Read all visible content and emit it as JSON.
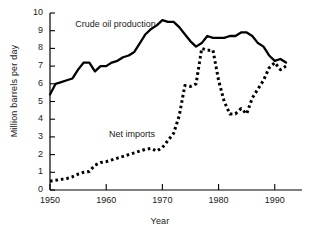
{
  "chart_data": {
    "type": "line",
    "title": "",
    "xlabel": "Year",
    "ylabel": "Million barrels per day",
    "xlim": [
      1950,
      1992
    ],
    "ylim": [
      0,
      10
    ],
    "xticks": [
      1950,
      1960,
      1970,
      1980,
      1990
    ],
    "yticks": [
      0,
      1,
      2,
      3,
      4,
      5,
      6,
      7,
      8,
      9,
      10
    ],
    "grid": false,
    "legend": "inline-annotations",
    "annotations": [
      {
        "text": "Crude oil production",
        "x": 1954.5,
        "y": 9.35
      },
      {
        "text": "Net imports",
        "x": 1960.5,
        "y": 3.1
      }
    ],
    "series": [
      {
        "name": "Crude oil production",
        "style": "solid",
        "color": "#000000",
        "x": [
          1950,
          1951,
          1952,
          1953,
          1954,
          1955,
          1956,
          1957,
          1958,
          1959,
          1960,
          1961,
          1962,
          1963,
          1964,
          1965,
          1966,
          1967,
          1968,
          1969,
          1970,
          1971,
          1972,
          1973,
          1974,
          1975,
          1976,
          1977,
          1978,
          1979,
          1980,
          1981,
          1982,
          1983,
          1984,
          1985,
          1986,
          1987,
          1988,
          1989,
          1990,
          1991,
          1992
        ],
        "values": [
          5.4,
          6.0,
          6.1,
          6.2,
          6.3,
          6.8,
          7.2,
          7.2,
          6.7,
          7.0,
          7.0,
          7.2,
          7.3,
          7.5,
          7.6,
          7.8,
          8.3,
          8.8,
          9.1,
          9.3,
          9.6,
          9.5,
          9.5,
          9.2,
          8.8,
          8.4,
          8.1,
          8.3,
          8.7,
          8.6,
          8.6,
          8.6,
          8.7,
          8.7,
          8.9,
          8.9,
          8.7,
          8.3,
          8.1,
          7.6,
          7.3,
          7.4,
          7.2
        ]
      },
      {
        "name": "Net imports",
        "style": "dotted",
        "color": "#000000",
        "x": [
          1950,
          1951,
          1952,
          1953,
          1954,
          1955,
          1956,
          1957,
          1958,
          1959,
          1960,
          1961,
          1962,
          1963,
          1964,
          1965,
          1966,
          1967,
          1968,
          1969,
          1970,
          1971,
          1972,
          1973,
          1974,
          1975,
          1976,
          1977,
          1978,
          1979,
          1980,
          1981,
          1982,
          1983,
          1984,
          1985,
          1986,
          1987,
          1988,
          1989,
          1990,
          1991,
          1992
        ],
        "values": [
          0.5,
          0.55,
          0.6,
          0.65,
          0.75,
          0.9,
          1.0,
          1.05,
          1.4,
          1.55,
          1.6,
          1.7,
          1.8,
          1.9,
          2.0,
          2.1,
          2.2,
          2.3,
          2.35,
          2.2,
          2.4,
          2.8,
          3.2,
          4.2,
          5.9,
          5.85,
          6.0,
          8.0,
          7.9,
          7.9,
          6.2,
          5.0,
          4.3,
          4.3,
          4.6,
          4.3,
          5.2,
          5.7,
          6.2,
          6.9,
          7.2,
          6.8,
          7.0
        ]
      }
    ]
  },
  "axes": {
    "y_tick_labels": [
      "10",
      "9",
      "8",
      "7",
      "6",
      "5",
      "4",
      "3",
      "2",
      "1",
      "0"
    ],
    "x_tick_labels": [
      "1950",
      "1960",
      "1970",
      "1980",
      "1990"
    ],
    "y_axis_title": "Million barrels per day",
    "x_axis_title": "Year"
  },
  "series_labels": {
    "production": "Crude oil production",
    "imports": "Net imports"
  }
}
